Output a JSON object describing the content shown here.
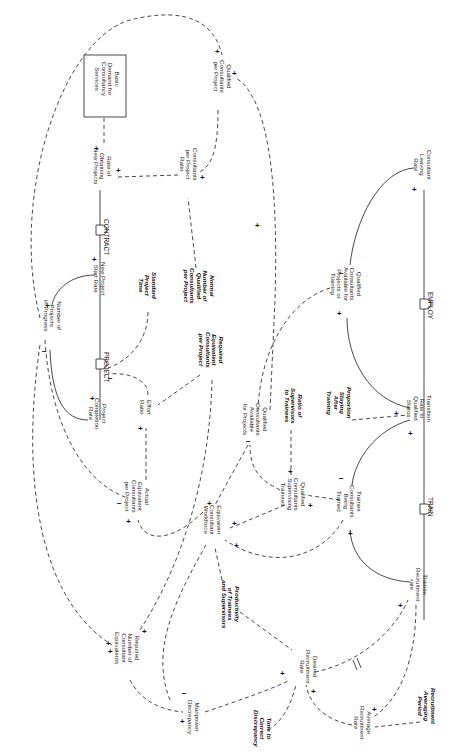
{
  "diagram": {
    "type": "causal-loop / stock-and-flow diagram (rotated 90° clockwise)",
    "orientation_deg": 90,
    "nodes": {
      "basic_demand": [
        "Basic",
        "Demand for",
        "Consultancy",
        "Services"
      ],
      "rate_obtaining": [
        "Rate of",
        "Obtaining",
        "New Projects"
      ],
      "consultants_ratio": [
        "Consultants",
        "per Project",
        "Ratio"
      ],
      "qualified_per_project": [
        "Qualified",
        "Consultants",
        "per Project"
      ],
      "new_project_start": [
        "New Project",
        "Start Rate"
      ],
      "standard_time": [
        "Standard",
        "Project",
        "Time"
      ],
      "normal_number": [
        "Normal",
        "Number of",
        "Qualified",
        "Consultants",
        "per Project"
      ],
      "projects_in_progress": [
        "Number of",
        "Projects",
        "in Progress"
      ],
      "required_equiv": [
        "Required",
        "Equivalent",
        "Consultants",
        "per Project"
      ],
      "effort_ratio": [
        "Effort",
        "Ratio"
      ],
      "completion_rate": [
        "Project",
        "Completion",
        "Rate"
      ],
      "actual_equiv": [
        "Actual",
        "Equivalent",
        "Consultants",
        "per Project"
      ],
      "equiv_workforce": [
        "Equivalent",
        "Consultant",
        "Workforce"
      ],
      "qc_available_projects": [
        "Qualified",
        "Consultants",
        "Available",
        "for Projects"
      ],
      "ratio_supervisors": [
        "Ratio of",
        "Supervisors",
        "to Trainees"
      ],
      "qc_supervising": [
        "Qualified",
        "Consultants",
        "Supervising",
        "Trainees"
      ],
      "qc_available_training": [
        "Qualified",
        "Consultants",
        "Available for",
        "Projects or",
        "Training"
      ],
      "leaving_rate": [
        "Consultant",
        "Leaving",
        "Rate"
      ],
      "transition_rate": [
        "Transition",
        "Rate to",
        "Qualified",
        "Status"
      ],
      "proportion_staying": [
        "Proportion",
        "Staying",
        "After",
        "Training"
      ],
      "trainees": [
        "Trainee",
        "Consultants",
        "Being",
        "Trained"
      ],
      "trainee_recruitment": [
        "Trainee",
        "Recruitment",
        "rate"
      ],
      "productivity": [
        "Productivity",
        "of Trainees",
        "and Supervisors"
      ],
      "desired_recruitment": [
        "Desired",
        "Recruitment",
        "Rate"
      ],
      "required_number": [
        "Required",
        "Number of",
        "Consultant",
        "Equivalents"
      ],
      "manpower_discrepancy": [
        "Manpower",
        "Discrepancy"
      ],
      "time_to_correct": [
        "Time to",
        "Correct",
        "Discrepancy"
      ],
      "avg_recruitment": [
        "Average",
        "Recruitment",
        "Rate"
      ],
      "averaging_period": [
        "Recruitment",
        "Averaging",
        "Period"
      ]
    },
    "valves": {
      "contract": "CONTRACT",
      "project": "PROJECT",
      "employ": "EMPLOY",
      "train": "TRAIN"
    },
    "signs": {
      "plus": "+",
      "minus": "−"
    },
    "colors": {
      "line": "#333333",
      "text": "#222222",
      "background": "#ffffff"
    }
  }
}
